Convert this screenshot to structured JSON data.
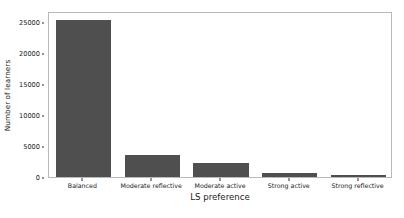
{
  "chart_data": {
    "type": "bar",
    "title": "",
    "xlabel": "LS preference",
    "ylabel": "Number of learners",
    "categories": [
      "Balanced",
      "Moderate reflective",
      "Moderate active",
      "Strong active",
      "Strong reflective"
    ],
    "values": [
      25400,
      3550,
      2250,
      650,
      400
    ],
    "ylim": [
      0,
      26800
    ],
    "yticks": [
      0,
      5000,
      10000,
      15000,
      20000,
      25000
    ],
    "ytick_labels": [
      "0",
      "5000",
      "10000",
      "15000",
      "20000",
      "25000"
    ],
    "grid": false,
    "legend": null,
    "bar_color": "#4f4f4f",
    "background_color": "#ffffff",
    "frame_color": "#b9b9b9"
  }
}
